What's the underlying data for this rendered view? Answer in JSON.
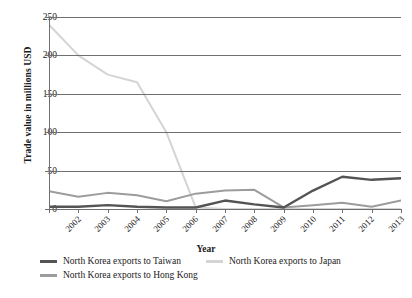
{
  "chart_data": {
    "type": "line",
    "title": "",
    "xlabel": "Year",
    "ylabel": "Trade value in millions USD",
    "categories": [
      "2002",
      "2003",
      "2004",
      "2005",
      "2006",
      "2007",
      "2008",
      "2009",
      "2010",
      "2011",
      "2012",
      "2013",
      "2014"
    ],
    "ylim": [
      0,
      250
    ],
    "yticks": [
      0,
      50,
      100,
      150,
      200,
      250
    ],
    "grid": true,
    "legend_position": "bottom",
    "series": [
      {
        "name": "North Korea exports to Taiwan",
        "color": "#545454",
        "values": [
          3,
          3,
          5,
          3,
          2,
          2,
          11,
          6,
          2,
          24,
          42,
          38,
          40
        ]
      },
      {
        "name": "North Korea exports to Hong Kong",
        "color": "#9c9c9c",
        "values": [
          23,
          16,
          21,
          18,
          10,
          20,
          24,
          25,
          2,
          5,
          8,
          3,
          11
        ]
      },
      {
        "name": "North Korea exports to Japan",
        "color": "#d4d4d4",
        "values": [
          240,
          200,
          175,
          165,
          100,
          2,
          0,
          0,
          0,
          0,
          0,
          0,
          0
        ]
      }
    ]
  },
  "axis": {
    "y_labels": [
      "250",
      "200",
      "150",
      "100",
      "50",
      "0"
    ],
    "x_title": "Year",
    "y_title": "Trade value in millions USD"
  },
  "legend": {
    "items": [
      {
        "label": "North Korea exports to Taiwan",
        "color": "#545454"
      },
      {
        "label": "North Korea exports to Japan",
        "color": "#d4d4d4"
      },
      {
        "label": "North Korea exports to Hong Kong",
        "color": "#9c9c9c"
      }
    ]
  }
}
